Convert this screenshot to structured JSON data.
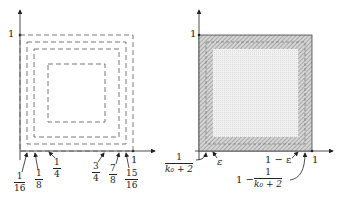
{
  "left_diagram": {
    "y_axis_label": "1",
    "x_axis_one_label": "1",
    "tick_labels": [
      {
        "num": "1",
        "den": "16"
      },
      {
        "num": "1",
        "den": "8"
      },
      {
        "num": "1",
        "den": "4"
      },
      {
        "num": "3",
        "den": "4"
      },
      {
        "num": "7",
        "den": "8"
      },
      {
        "num": "15",
        "den": "16"
      }
    ],
    "nested_squares": [
      {
        "inner": "0",
        "outer": "1"
      },
      {
        "inner": "1/16",
        "outer": "15/16"
      },
      {
        "inner": "1/8",
        "outer": "7/8"
      },
      {
        "inner": "1/4",
        "outer": "3/4"
      }
    ],
    "line_style": "dashed"
  },
  "right_diagram": {
    "y_axis_label": "1",
    "x_axis_one_label": "1",
    "labels": {
      "left_frac_num": "1",
      "left_frac_den": "k₀ + 2",
      "epsilon": "ε",
      "one_minus_eps": "1 − ε",
      "right_prefix": "1 −",
      "right_frac_num": "1",
      "right_frac_den": "k₀ + 2"
    },
    "regions": {
      "outer_band": "hatched",
      "inner_square": "dotted-fill"
    }
  }
}
